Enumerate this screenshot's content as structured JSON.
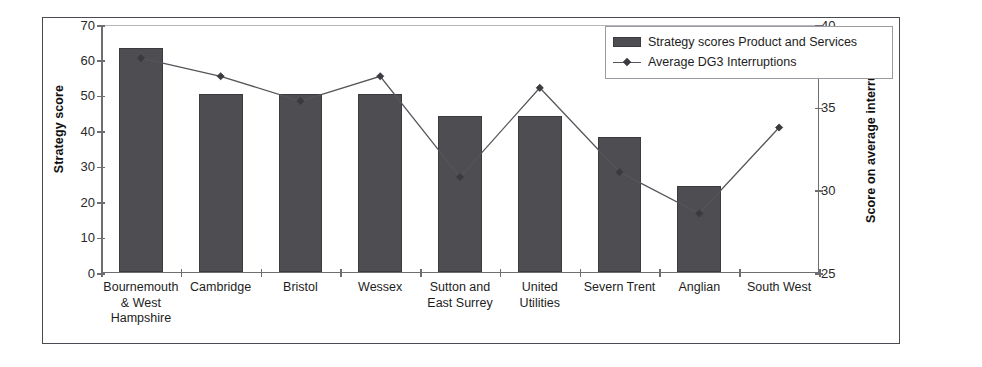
{
  "chart_data": {
    "type": "bar",
    "title": "",
    "subtitle": "",
    "xlabel": "",
    "ylabel": "Strategy score",
    "y2label": "Score on average interruptions",
    "ylim": [
      0,
      70
    ],
    "y2lim": [
      25,
      40
    ],
    "grid": false,
    "legend_position": "top-right",
    "categories": [
      "Bournemouth & West Hampshire",
      "Cambridge",
      "Bristol",
      "Wessex",
      "Sutton and East Surrey",
      "United Utilities",
      "Severn Trent",
      "Anglian",
      "South West"
    ],
    "category_lines": [
      [
        "Bournemouth",
        "& West",
        "Hampshire"
      ],
      [
        "Cambridge"
      ],
      [
        "Bristol"
      ],
      [
        "Wessex"
      ],
      [
        "Sutton and",
        "East Surrey"
      ],
      [
        "United",
        "Utilities"
      ],
      [
        "Severn Trent"
      ],
      [
        "Anglian"
      ],
      [
        "South West"
      ]
    ],
    "yticks": [
      0,
      10,
      20,
      30,
      40,
      50,
      60,
      70
    ],
    "y2ticks": [
      25,
      30,
      35,
      40
    ],
    "series": [
      {
        "name": "Strategy scores Product and Services",
        "type": "bar",
        "axis": "left",
        "color": "#4d4d52",
        "values": [
          63,
          50,
          50,
          50,
          44,
          44,
          38,
          24,
          null
        ]
      },
      {
        "name": "Average DG3 Interruptions",
        "type": "line",
        "axis": "right",
        "color": "#55555a",
        "marker": "diamond",
        "values": [
          38.0,
          36.9,
          35.4,
          36.9,
          30.8,
          36.2,
          31.1,
          28.6,
          33.8
        ]
      }
    ]
  },
  "legend": {
    "items": [
      {
        "label": "Strategy scores Product and Services",
        "swatch": "bar-swatch"
      },
      {
        "label": "Average DG3 Interruptions",
        "swatch": "line-marker-swatch"
      }
    ]
  },
  "axes": {
    "left_title": "Strategy score",
    "right_title": "Score on average interruptions",
    "left_ticks": [
      "70",
      "60",
      "50",
      "40",
      "30",
      "20",
      "10",
      "0"
    ],
    "right_ticks": [
      "40",
      "35",
      "30",
      "25"
    ]
  },
  "colors": {
    "bar_fill": "#4d4d52",
    "line_stroke": "#55555a",
    "axis": "#6d6d72",
    "frame": "#4a4a52",
    "text": "#1d1d1d"
  }
}
